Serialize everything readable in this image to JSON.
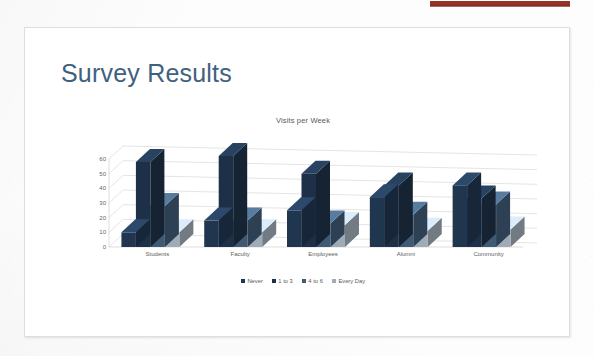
{
  "document": {
    "kind": "scanned-presentation-slide",
    "slide_title": "Survey Results"
  },
  "top_strip": {
    "name": "red-banner-fragment",
    "color": "#8f2d21"
  },
  "chart_data": {
    "type": "bar",
    "title": "Visits per Week",
    "xlabel": "",
    "ylabel": "",
    "ylim": [
      0,
      60
    ],
    "yticks": [
      0,
      10,
      20,
      30,
      40,
      50,
      60
    ],
    "grid": true,
    "legend_position": "bottom",
    "style": "3d-clustered-column",
    "categories": [
      "Students",
      "Faculty",
      "Employees",
      "Alumni",
      "Community"
    ],
    "series": [
      {
        "name": "Never",
        "color": "#20354e",
        "values": [
          10,
          18,
          25,
          34,
          42
        ]
      },
      {
        "name": "1 to 3",
        "color": "#1d3047",
        "values": [
          58,
          62,
          50,
          42,
          33
        ]
      },
      {
        "name": "4 to 6",
        "color": "#405a74",
        "values": [
          28,
          18,
          16,
          22,
          29
        ]
      },
      {
        "name": "Every Day",
        "color": "#9fabb6",
        "values": [
          10,
          10,
          15,
          11,
          12
        ]
      }
    ]
  }
}
